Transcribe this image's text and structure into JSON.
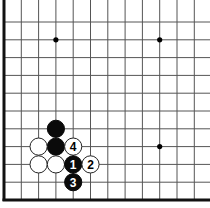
{
  "board": {
    "type": "go-diagram",
    "grid": {
      "columns": 12,
      "rows": 11,
      "origin_x": 4,
      "origin_y": 22,
      "spacing_x": 17.3,
      "spacing_y": 17.8,
      "edges": [
        "left",
        "bottom"
      ]
    },
    "colors": {
      "background": "#ffffff",
      "line": "#555555",
      "border": "#111111",
      "black_stone": "#0a0a0a",
      "white_stone": "#ffffff",
      "white_stone_outline": "#222222"
    },
    "star_points": [
      {
        "col": 3,
        "row": 1
      },
      {
        "col": 9,
        "row": 1
      },
      {
        "col": 9,
        "row": 7
      }
    ],
    "stones": [
      {
        "color": "black",
        "col": 3,
        "row": 6,
        "label": ""
      },
      {
        "color": "black",
        "col": 3,
        "row": 7,
        "label": ""
      },
      {
        "color": "white",
        "col": 2,
        "row": 7,
        "label": ""
      },
      {
        "color": "white",
        "col": 4,
        "row": 7,
        "label": "4"
      },
      {
        "color": "white",
        "col": 2,
        "row": 8,
        "label": ""
      },
      {
        "color": "white",
        "col": 3,
        "row": 8,
        "label": ""
      },
      {
        "color": "black",
        "col": 4,
        "row": 8,
        "label": "1"
      },
      {
        "color": "white",
        "col": 5,
        "row": 8,
        "label": "2"
      },
      {
        "color": "black",
        "col": 4,
        "row": 9,
        "label": "3"
      }
    ]
  }
}
